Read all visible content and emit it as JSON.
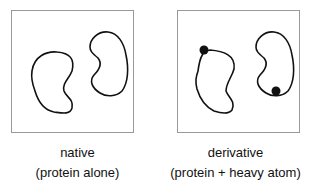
{
  "panels": [
    {
      "id": "native",
      "title": "native",
      "subtitle": "(protein alone)",
      "heavy_atoms": 0
    },
    {
      "id": "derivative",
      "title": "derivative",
      "subtitle": "(protein + heavy atom)",
      "heavy_atoms": 2
    }
  ],
  "colors": {
    "outline": "#111111",
    "border": "#999999",
    "atom": "#111111"
  }
}
